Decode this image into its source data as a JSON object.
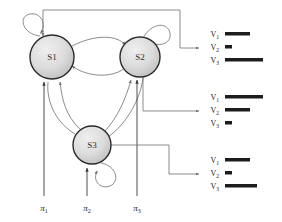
{
  "diagram": {
    "states": [
      {
        "id": "s1",
        "label": "S1",
        "cx": 52,
        "cy": 57,
        "r": 22
      },
      {
        "id": "s2",
        "label": "S2",
        "cx": 140,
        "cy": 57,
        "r": 20
      },
      {
        "id": "s3",
        "label": "S3",
        "cx": 92,
        "cy": 145,
        "r": 19
      }
    ],
    "initial_probabilities": [
      {
        "id": "pi1",
        "label": "π",
        "subscript": "1",
        "x": 44,
        "y": 208
      },
      {
        "id": "pi2",
        "label": "π",
        "subscript": "2",
        "x": 87,
        "y": 208
      },
      {
        "id": "pi3",
        "label": "π",
        "subscript": "3",
        "x": 137,
        "y": 208
      }
    ],
    "emission_groups": [
      {
        "id": "emissions-state-1",
        "source_state": "S1",
        "top": 32,
        "symbols": [
          {
            "label": "V",
            "subscript": "1",
            "bar_width": 25
          },
          {
            "label": "V",
            "subscript": "2",
            "bar_width": 7
          },
          {
            "label": "V",
            "subscript": "3",
            "bar_width": 38
          }
        ]
      },
      {
        "id": "emissions-state-2",
        "source_state": "S2",
        "top": 95,
        "symbols": [
          {
            "label": "V",
            "subscript": "1",
            "bar_width": 38
          },
          {
            "label": "V",
            "subscript": "2",
            "bar_width": 25
          },
          {
            "label": "V",
            "subscript": "3",
            "bar_width": 7
          }
        ]
      },
      {
        "id": "emissions-state-3",
        "source_state": "S3",
        "top": 158,
        "symbols": [
          {
            "label": "V",
            "subscript": "1",
            "bar_width": 25
          },
          {
            "label": "V",
            "subscript": "2",
            "bar_width": 7
          },
          {
            "label": "V",
            "subscript": "3",
            "bar_width": 32
          }
        ]
      }
    ],
    "colors": {
      "state_fill_light": "#e6e6e6",
      "state_fill_dark": "#b9b9b9",
      "state_stroke": "#2b2b2b",
      "edge": "#6e6e6e",
      "edge_dark": "#3a3a3a",
      "bar": "#1c1c1c",
      "background": "#ffffff"
    }
  }
}
